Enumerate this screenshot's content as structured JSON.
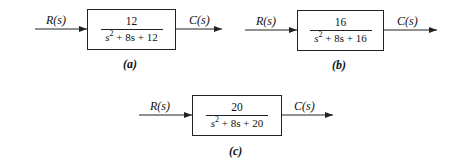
{
  "diagrams": [
    {
      "id": "a",
      "input_label": "R(s)",
      "output_label": "C(s)",
      "numerator": "12",
      "denominator": {
        "s_term": "s",
        "exp": "2",
        "rest": " + 8s + 12"
      },
      "caption": "(a)"
    },
    {
      "id": "b",
      "input_label": "R(s)",
      "output_label": "C(s)",
      "numerator": "16",
      "denominator": {
        "s_term": "s",
        "exp": "2",
        "rest": " + 8s + 16"
      },
      "caption": "(b)"
    },
    {
      "id": "c",
      "input_label": "R(s)",
      "output_label": "C(s)",
      "numerator": "20",
      "denominator": {
        "s_term": "s",
        "exp": "2",
        "rest": " + 8s + 20"
      },
      "caption": "(c)"
    }
  ],
  "colors": {
    "stroke": "#222222",
    "background": "#ffffff"
  }
}
